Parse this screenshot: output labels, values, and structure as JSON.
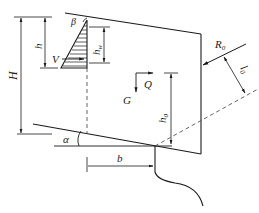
{
  "diagram": {
    "type": "engineering force diagram",
    "labels": {
      "beta": "β",
      "h": "h",
      "H": "H",
      "V": "V",
      "hw": "h",
      "hw_sub": "w",
      "R0": "R",
      "R0_sub": "0",
      "l0": "l",
      "l0_sub": "0",
      "G": "G",
      "Q": "Q",
      "h0": "h",
      "h0_sub": "0",
      "alpha": "α",
      "b": "b"
    },
    "colors": {
      "stroke": "#1a1a1a",
      "dashed": "#555555",
      "background": "#ffffff"
    }
  }
}
